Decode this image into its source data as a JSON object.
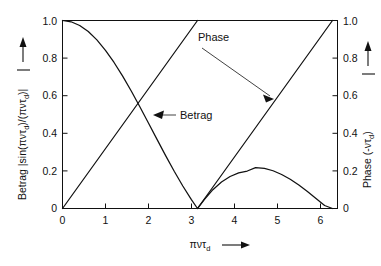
{
  "chart_data": {
    "type": "line",
    "title": "",
    "xlabel": "πντ_d",
    "xlabel_text": "πντ",
    "xlabel_sub": "d",
    "xlabel_arrow": "⟶",
    "ylabel_left_prefix": "Betrag",
    "ylabel_left": "Betrag |sin(πντ_d)/(πντ_d)|",
    "ylabel_right": "Phase (-ντ_d)",
    "ylabel_right_text": "Phase (-ντ",
    "ylabel_right_tail": ")",
    "ylabel_arrow_up": "↑",
    "xlim": [
      0,
      6.4
    ],
    "ylim": [
      0,
      1.0
    ],
    "xticks": [
      0,
      1,
      2,
      3,
      4,
      5,
      6
    ],
    "xtick_labels": [
      "0",
      "1",
      "2",
      "3",
      "4",
      "5",
      "6"
    ],
    "yticks_left": [
      0,
      0.2,
      0.4,
      0.6,
      0.8,
      1.0
    ],
    "ytick_labels_left": [
      "0",
      "0.2",
      "0.4",
      "0.6",
      "0.8",
      "1.0"
    ],
    "yticks_right": [
      0,
      0.2,
      0.4,
      0.6,
      0.8,
      1.0
    ],
    "ytick_labels_right": [
      "0",
      "0.2",
      "0.4",
      "0.6",
      "0.8",
      "1.0"
    ],
    "grid": false,
    "legend_position": "inline-annotations",
    "series": [
      {
        "name": "Betrag",
        "axis": "left",
        "description": "|sin(x)/x| magnitude, zero at x=π and x=2π, second lobe peak ≈ 0.217 at x≈4.49",
        "x": [
          0,
          0.2,
          0.4,
          0.6,
          0.8,
          1.0,
          1.2,
          1.4,
          1.6,
          1.8,
          2.0,
          2.2,
          2.4,
          2.6,
          2.8,
          3.0,
          3.1416,
          3.3,
          3.5,
          3.7,
          3.9,
          4.1,
          4.3,
          4.4934,
          4.7,
          4.9,
          5.1,
          5.3,
          5.5,
          5.7,
          5.9,
          6.1,
          6.2832
        ],
        "y": [
          1.0,
          0.9933,
          0.9735,
          0.9411,
          0.8967,
          0.8415,
          0.7767,
          0.7039,
          0.6247,
          0.541,
          0.4546,
          0.3675,
          0.2814,
          0.1983,
          0.1196,
          0.047,
          0.0,
          0.0478,
          0.1002,
          0.1407,
          0.17,
          0.1891,
          0.1993,
          0.2172,
          0.2136,
          0.2008,
          0.181,
          0.1552,
          0.1245,
          0.0903,
          0.0537,
          0.016,
          0.0
        ]
      },
      {
        "name": "Phase",
        "axis": "right",
        "description": "Sawtooth phase: rises linearly 0→1 over 0→π, resets to 0, rises linearly 0→1 over π→2π",
        "x": [
          0,
          3.1416,
          3.1416,
          6.2832
        ],
        "y": [
          0,
          1.0,
          0.0,
          1.0
        ]
      }
    ],
    "annotations": [
      {
        "label": "Phase",
        "target_x": 4.05,
        "target_y": 0.59,
        "note": "leader line from label down-right to the rising phase line"
      },
      {
        "label": "Betrag",
        "target_x": 2.2,
        "target_y": 0.375,
        "note": "leader line from label left to the descending magnitude curve"
      }
    ]
  }
}
